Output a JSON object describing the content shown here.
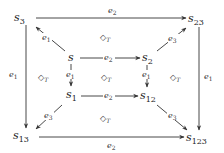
{
  "diagram": {
    "type": "commutative-cube",
    "nodes": [
      {
        "id": "s3",
        "base": "s",
        "sub": "3",
        "x": 24,
        "y": 21
      },
      {
        "id": "s23",
        "base": "s",
        "sub": "23",
        "x": 199,
        "y": 22
      },
      {
        "id": "s",
        "base": "s",
        "sub": "",
        "x": 71,
        "y": 61
      },
      {
        "id": "s2",
        "base": "s",
        "sub": "2",
        "x": 150,
        "y": 61
      },
      {
        "id": "s1",
        "base": "s",
        "sub": "1",
        "x": 71,
        "y": 98
      },
      {
        "id": "s12",
        "base": "s",
        "sub": "12",
        "x": 150,
        "y": 99
      },
      {
        "id": "s13",
        "base": "s",
        "sub": "13",
        "x": 24,
        "y": 139
      },
      {
        "id": "s123",
        "base": "s",
        "sub": "123",
        "x": 199,
        "y": 141
      }
    ],
    "edges": [
      {
        "from": "s3",
        "to": "s23",
        "label_base": "e",
        "label_sub": "2"
      },
      {
        "from": "s",
        "to": "s3",
        "label_base": "e",
        "label_sub": "1"
      },
      {
        "from": "s2",
        "to": "s23",
        "label_base": "e",
        "label_sub": "3"
      },
      {
        "from": "s",
        "to": "s2",
        "label_base": "e",
        "label_sub": "2"
      },
      {
        "from": "s",
        "to": "s1",
        "label_base": "e",
        "label_sub": "1"
      },
      {
        "from": "s2",
        "to": "s12",
        "label_base": "e",
        "label_sub": "1"
      },
      {
        "from": "s1",
        "to": "s12",
        "label_base": "e",
        "label_sub": "2"
      },
      {
        "from": "s3",
        "to": "s13",
        "label_base": "e",
        "label_sub": "1"
      },
      {
        "from": "s23",
        "to": "s123",
        "label_base": "e",
        "label_sub": "1"
      },
      {
        "from": "s1",
        "to": "s13",
        "label_base": "e",
        "label_sub": "3"
      },
      {
        "from": "s12",
        "to": "s123",
        "label_base": "e",
        "label_sub": "3"
      },
      {
        "from": "s13",
        "to": "s123",
        "label_base": "e",
        "label_sub": "2"
      }
    ],
    "commute_markers": [
      {
        "symbol": "◇",
        "sub": "T",
        "position": "top-face"
      },
      {
        "symbol": "◇",
        "sub": "T",
        "position": "left-face"
      },
      {
        "symbol": "◇",
        "sub": "T",
        "position": "center-face"
      },
      {
        "symbol": "◇",
        "sub": "T",
        "position": "right-face"
      },
      {
        "symbol": "◇",
        "sub": "T",
        "position": "bottom-face"
      }
    ]
  }
}
